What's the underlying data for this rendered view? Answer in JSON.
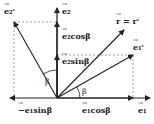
{
  "diagram": {
    "type": "vector-decomposition",
    "colors": {
      "stroke": "#222222",
      "dashed": "#888888",
      "background": "#ffffff"
    },
    "origin": [
      57,
      98
    ],
    "labels": {
      "e2_prime": "e₂'",
      "e2": "e₂",
      "r_eq": "r = r'",
      "e1_prime": "e₁'",
      "e2_cos": "e₂cosβ",
      "e2_sin": "e₂sinβ",
      "beta_upper": "β",
      "beta_lower": "β",
      "neg_e1_sin": "−e₁sinβ",
      "e1_cos": "e₁cosβ",
      "e1": "e₁"
    }
  }
}
